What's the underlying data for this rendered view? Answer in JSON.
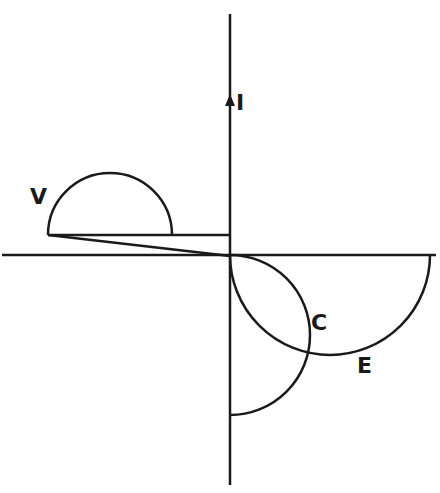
{
  "diagram": {
    "type": "phasor-diagram",
    "stroke_color": "#1a1a1a",
    "background": "#ffffff",
    "labels": {
      "current": "I",
      "voltage": "V",
      "capacitor": "C",
      "emf": "E"
    },
    "axes": {
      "vertical": {
        "x": 230,
        "y1": 14,
        "y2": 485,
        "arrow_at_y": 100
      },
      "horizontal": {
        "y": 255,
        "x1": 2,
        "x2": 436
      }
    },
    "curves": [
      {
        "name": "V",
        "kind": "semicircle-upper",
        "cx": 110,
        "cy": 235,
        "r": 62
      },
      {
        "name": "C",
        "kind": "semicircle-right",
        "cx": 230,
        "cy": 335,
        "r": 80
      },
      {
        "name": "E",
        "kind": "semicircle-lower",
        "cx": 330,
        "cy": 255,
        "r": 100
      }
    ],
    "lines": [
      {
        "name": "v-base-line",
        "x1": 48,
        "y1": 235,
        "x2": 230,
        "y2": 235
      },
      {
        "name": "v-diagonal-line",
        "x1": 48,
        "y1": 235,
        "x2": 230,
        "y2": 256
      }
    ]
  }
}
